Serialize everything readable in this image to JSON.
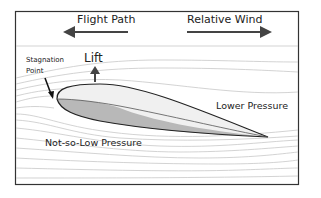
{
  "diagram": {
    "title_labels": {
      "flight_path": "Flight Path",
      "relative_wind": "Relative Wind"
    },
    "labels": {
      "lift": "Lift",
      "stagnation_line1": "Stagnation",
      "stagnation_line2": "Point",
      "lower_pressure": "Lower Pressure",
      "not_so_low_pressure": "Not-so-Low Pressure"
    },
    "arrows": {
      "flight_path_direction": "left",
      "relative_wind_direction": "right",
      "lift_direction": "up",
      "stagnation_pointer_direction": "down"
    },
    "colors": {
      "frame": "#333333",
      "arrow": "#444444",
      "airfoil_upper": "#f0f0f0",
      "airfoil_lower": "#b8b8b8",
      "airfoil_outline": "#222222",
      "streamline": "#c8c8c8",
      "text": "#222222"
    }
  }
}
